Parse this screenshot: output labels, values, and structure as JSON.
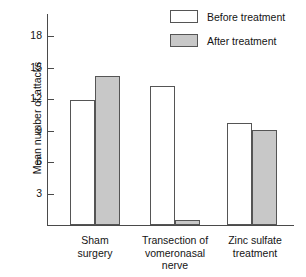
{
  "chart_data": {
    "type": "bar",
    "title": "",
    "xlabel": "",
    "ylabel": "Mean number of attacks",
    "ylim": [
      0,
      20.2
    ],
    "yticks": [
      3,
      6,
      9,
      12,
      15,
      18
    ],
    "ytick_labels": [
      "3",
      "6",
      "9",
      "12",
      "15",
      "18"
    ],
    "grid": false,
    "legend_position": "top-right",
    "categories": [
      "Sham surgery",
      "Transection of vomeronasal nerve",
      "Zinc sulfate treatment"
    ],
    "category_label_lines": [
      [
        "Sham",
        "surgery"
      ],
      [
        "Transection of",
        "vomeronasal",
        "nerve"
      ],
      [
        "Zinc sulfate",
        "treatment"
      ]
    ],
    "series": [
      {
        "name": "Before treatment",
        "color": "#ffffff",
        "values": [
          12.0,
          13.3,
          9.8
        ]
      },
      {
        "name": "After treatment",
        "color": "#c8c8c8",
        "values": [
          14.3,
          0.5,
          9.1
        ]
      }
    ]
  },
  "legend": {
    "items": [
      {
        "label": "Before treatment",
        "swatch": "white"
      },
      {
        "label": "After treatment",
        "swatch": "gray"
      }
    ]
  },
  "axis": {
    "y_title": "Mean number of attacks",
    "tick_3": "3",
    "tick_6": "6",
    "tick_9": "9",
    "tick_12": "12",
    "tick_15": "15",
    "tick_18": "18"
  },
  "groups": {
    "g0_line0": "Sham",
    "g0_line1": "surgery",
    "g1_line0": "Transection of",
    "g1_line1": "vomeronasal",
    "g1_line2": "nerve",
    "g2_line0": "Zinc sulfate",
    "g2_line1": "treatment"
  },
  "colors": {
    "before_fill": "#ffffff",
    "after_fill": "#c8c8c8",
    "bar_stroke": "#555555",
    "axis": "#4a4a4a"
  }
}
